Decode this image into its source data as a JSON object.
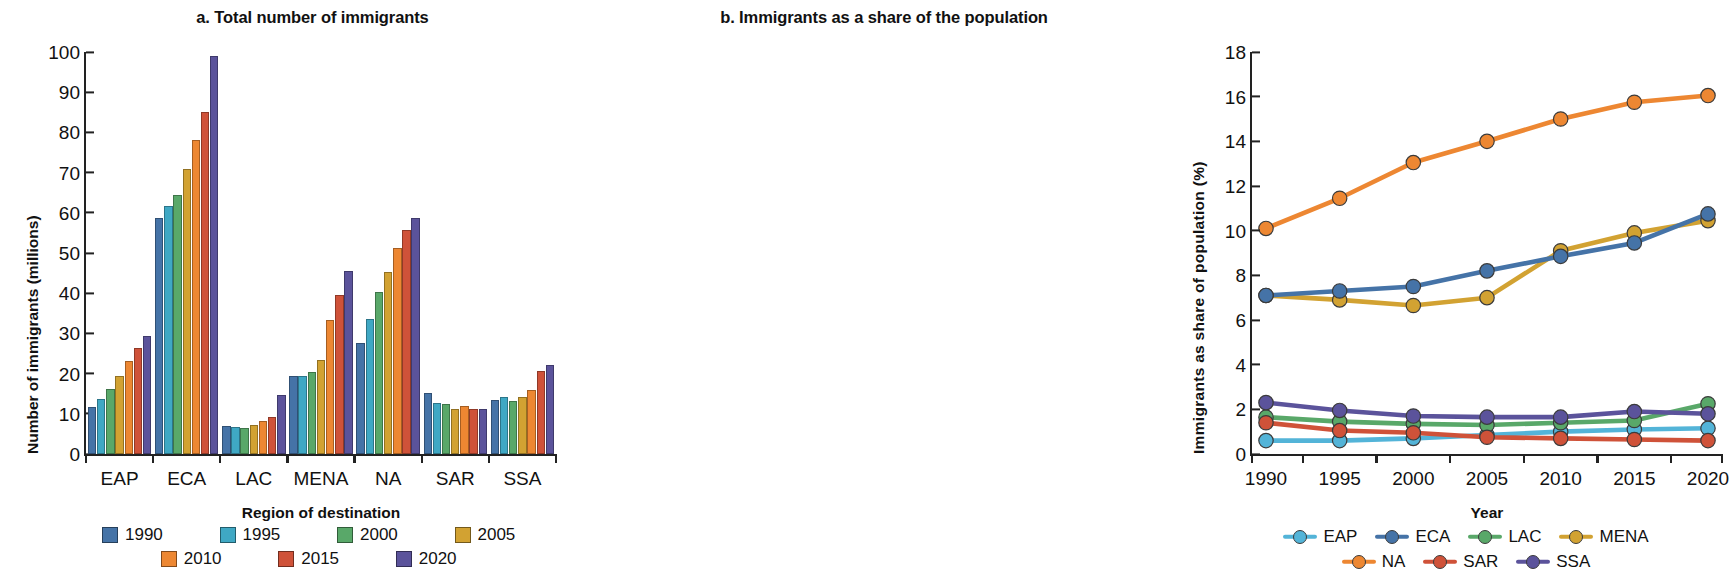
{
  "chart_data": [
    {
      "type": "bar",
      "panel_label": "a.",
      "title": "a. Total number of immigrants",
      "xlabel": "Region of destination",
      "ylabel": "Number of immigrants (millions)",
      "ylim": [
        0,
        100
      ],
      "yticks": [
        0,
        10,
        20,
        30,
        40,
        50,
        60,
        70,
        80,
        90,
        100
      ],
      "categories": [
        "EAP",
        "ECA",
        "LAC",
        "MENA",
        "NA",
        "SAR",
        "SSA"
      ],
      "grid": false,
      "legend_position": "bottom",
      "series": [
        {
          "name": "1990",
          "color": "#4573a7",
          "values": [
            11.7,
            58.6,
            7.0,
            19.4,
            27.6,
            15.2,
            13.4
          ]
        },
        {
          "name": "1995",
          "color": "#3fa8c4",
          "values": [
            13.7,
            61.8,
            6.6,
            19.4,
            33.5,
            12.7,
            14.3
          ]
        },
        {
          "name": "2000",
          "color": "#59a869",
          "values": [
            16.1,
            64.4,
            6.4,
            20.3,
            40.4,
            12.4,
            13.3
          ]
        },
        {
          "name": "2005",
          "color": "#d2a232",
          "values": [
            19.3,
            71.0,
            7.1,
            23.4,
            45.4,
            11.1,
            14.2
          ]
        },
        {
          "name": "2010",
          "color": "#ed8732",
          "values": [
            23.2,
            78.0,
            8.3,
            33.3,
            51.2,
            11.9,
            15.9
          ]
        },
        {
          "name": "2015",
          "color": "#cf5239",
          "values": [
            26.4,
            85.0,
            9.3,
            39.6,
            55.8,
            11.1,
            20.7
          ]
        },
        {
          "name": "2020",
          "color": "#5b539b",
          "values": [
            29.4,
            98.9,
            14.7,
            45.6,
            58.8,
            11.1,
            22.1
          ]
        }
      ]
    },
    {
      "type": "line",
      "panel_label": "b.",
      "title": "b. Immigrants as a share of the population",
      "xlabel": "Year",
      "ylabel": "Immigrants as  share of population (%)",
      "ylim": [
        0,
        18
      ],
      "yticks": [
        0,
        2,
        4,
        6,
        8,
        10,
        12,
        14,
        16,
        18
      ],
      "x": [
        "1990",
        "1995",
        "2000",
        "2005",
        "2010",
        "2015",
        "2020"
      ],
      "grid": false,
      "legend_position": "bottom",
      "series": [
        {
          "name": "EAP",
          "color": "#53b4d8",
          "values": [
            0.6,
            0.6,
            0.7,
            0.85,
            1.0,
            1.1,
            1.15
          ]
        },
        {
          "name": "ECA",
          "color": "#4573a7",
          "values": [
            7.1,
            7.3,
            7.5,
            8.2,
            8.85,
            9.45,
            10.75
          ]
        },
        {
          "name": "LAC",
          "color": "#59a869",
          "values": [
            1.65,
            1.45,
            1.35,
            1.3,
            1.4,
            1.5,
            2.25
          ]
        },
        {
          "name": "MENA",
          "color": "#d2a232",
          "values": [
            7.1,
            6.9,
            6.65,
            7.0,
            9.1,
            9.9,
            10.45
          ]
        },
        {
          "name": "NA",
          "color": "#ed8732",
          "values": [
            10.1,
            11.45,
            13.05,
            14.0,
            15.0,
            15.75,
            16.05
          ]
        },
        {
          "name": "SAR",
          "color": "#cf5239",
          "values": [
            1.4,
            1.05,
            0.95,
            0.75,
            0.7,
            0.65,
            0.6
          ]
        },
        {
          "name": "SSA",
          "color": "#5b539b",
          "values": [
            2.3,
            1.95,
            1.7,
            1.65,
            1.65,
            1.9,
            1.8
          ]
        }
      ]
    }
  ]
}
